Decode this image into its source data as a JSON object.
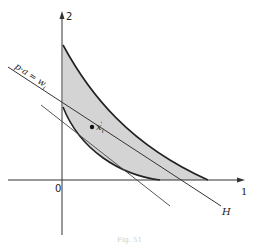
{
  "figure": {
    "axes": {
      "x_label": "1",
      "y_label": "2",
      "origin_label": "0"
    },
    "line_label": "p·a = w",
    "line_label_sub": "i",
    "hyperplane_label": "H",
    "point_label": "x",
    "point_label_sub": "i",
    "point_label_sup": "'",
    "caption": "Fig. 51",
    "colors": {
      "ink": "#222222",
      "shade": "#d4d4d4",
      "background": "#ffffff"
    }
  }
}
